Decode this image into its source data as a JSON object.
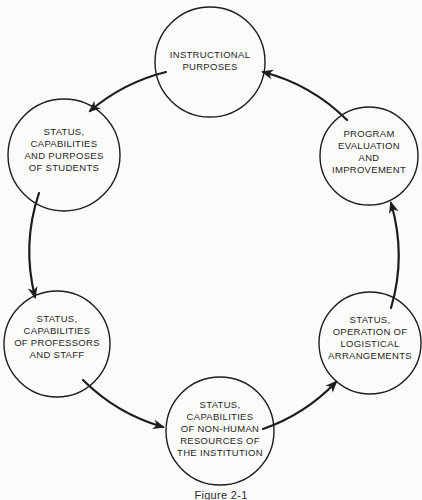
{
  "figure": {
    "caption": "Figure 2-1"
  },
  "nodes": [
    {
      "id": "instructional-purposes",
      "label": "INSTRUCTIONAL\nPURPOSES"
    },
    {
      "id": "students",
      "label": "STATUS,\nCAPABILITIES\nAND PURPOSES\nOF STUDENTS"
    },
    {
      "id": "program-evaluation",
      "label": "PROGRAM\nEVALUATION\nAND\nIMPROVEMENT"
    },
    {
      "id": "professors-staff",
      "label": "STATUS,\nCAPABILITIES\nOF PROFESSORS\nAND STAFF"
    },
    {
      "id": "logistical-arrangements",
      "label": "STATUS,\nOPERATION OF\nLOGISTICAL\nARRANGEMENTS"
    },
    {
      "id": "non-human-resources",
      "label": "STATUS,\nCAPABILITIES\nOF NON-HUMAN\nRESOURCES OF\nTHE INSTITUTION"
    }
  ],
  "edges": [
    {
      "from": "instructional-purposes",
      "to": "students"
    },
    {
      "from": "students",
      "to": "professors-staff"
    },
    {
      "from": "professors-staff",
      "to": "non-human-resources"
    },
    {
      "from": "non-human-resources",
      "to": "logistical-arrangements"
    },
    {
      "from": "logistical-arrangements",
      "to": "program-evaluation"
    },
    {
      "from": "program-evaluation",
      "to": "instructional-purposes"
    }
  ],
  "colors": {
    "background": "#fbfbf9",
    "stroke": "#1d1d1b",
    "text": "#1f1f1f"
  }
}
